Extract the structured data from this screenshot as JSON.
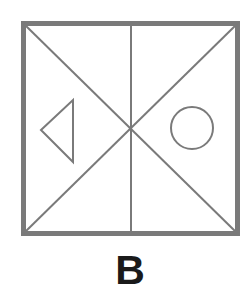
{
  "option": {
    "label": "B"
  },
  "figure": {
    "frame_color": "#7a7a7a",
    "line_color": "#7a7a7a",
    "elements": [
      {
        "type": "square-frame"
      },
      {
        "type": "diagonal",
        "from": "top-left",
        "to": "bottom-right"
      },
      {
        "type": "diagonal",
        "from": "top-right",
        "to": "bottom-left"
      },
      {
        "type": "vertical-center-line"
      },
      {
        "type": "triangle",
        "position": "left",
        "pointing": "left"
      },
      {
        "type": "circle",
        "position": "right"
      }
    ]
  }
}
